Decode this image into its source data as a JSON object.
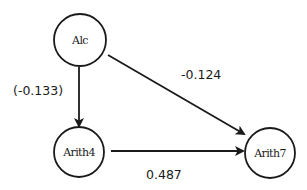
{
  "diagram": {
    "type": "path-diagram",
    "colors": {
      "stroke": "#1a1a1a",
      "background": "#ffffff"
    },
    "nodes": [
      {
        "id": "alc",
        "label": "Alc",
        "cx": 80,
        "cy": 40,
        "r": 26
      },
      {
        "id": "arith4",
        "label": "Arith4",
        "cx": 79,
        "cy": 152,
        "r": 25
      },
      {
        "id": "arith7",
        "label": "Arith7",
        "cx": 270,
        "cy": 153,
        "r": 25
      }
    ],
    "edges": [
      {
        "from": "alc",
        "to": "arith4",
        "label": "(-0.133)",
        "x1": 79,
        "y1": 67,
        "x2": 79,
        "y2": 126,
        "label_x": 13,
        "label_y": 95
      },
      {
        "from": "alc",
        "to": "arith7",
        "label": "-0.124",
        "x1": 108,
        "y1": 55,
        "x2": 244,
        "y2": 134,
        "label_x": 181,
        "label_y": 79
      },
      {
        "from": "arith4",
        "to": "arith7",
        "label": "0.487",
        "x1": 111,
        "y1": 151,
        "x2": 243,
        "y2": 151,
        "label_x": 146,
        "label_y": 179
      }
    ]
  }
}
